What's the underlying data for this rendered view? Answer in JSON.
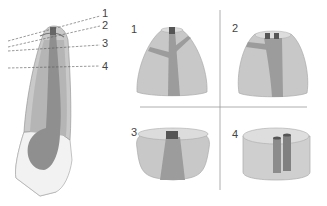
{
  "figure": {
    "left_panel": {
      "description": "Longitudinal section of a tooth with horizontal cut levels",
      "cut_labels": [
        "1",
        "2",
        "3",
        "4"
      ]
    },
    "right_panel": {
      "quadrants": [
        {
          "label": "1",
          "description": "Crown tip section, single canal opening"
        },
        {
          "label": "2",
          "description": "Section showing two canal openings"
        },
        {
          "label": "3",
          "description": "Low section with single canal"
        },
        {
          "label": "4",
          "description": "Cylindrical section with two parallel canals"
        }
      ]
    },
    "colors": {
      "enamel": "#c8c8c8",
      "dentin": "#bdbdbd",
      "pulp": "#8c8c8c",
      "canal_dark": "#555555",
      "root_white": "#f2f2f2",
      "outline": "#9a9a9a",
      "divider": "#999999",
      "dash": "#555555"
    }
  }
}
